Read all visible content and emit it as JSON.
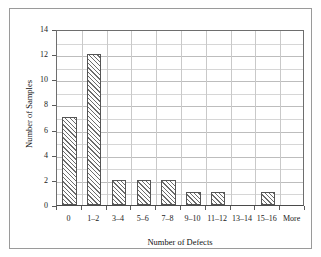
{
  "chart_data": {
    "type": "bar",
    "title": "",
    "subtitle": "",
    "xlabel": "Number of Defects",
    "ylabel": "Number of Samples",
    "categories": [
      "0",
      "1–2",
      "3–4",
      "5–6",
      "7–8",
      "9–10",
      "11–12",
      "13–14",
      "15–16",
      "More"
    ],
    "values": [
      7,
      12,
      2,
      2,
      2,
      1,
      1,
      0,
      1,
      0
    ],
    "ylim": [
      0,
      14
    ],
    "ytick_labels": [
      "0",
      "2",
      "4",
      "6",
      "8",
      "10",
      "12",
      "14"
    ],
    "ytick_values": [
      0,
      2,
      4,
      6,
      8,
      10,
      12,
      14
    ],
    "yminor_step": 1,
    "grid": "both",
    "legend": "none",
    "bar_fill": "diagonal-hatch",
    "bar_edge_color": "#555555",
    "hatch_color": "#6b6b6b",
    "background_color": "#ffffff",
    "frame_color": "#9a9a9a"
  }
}
